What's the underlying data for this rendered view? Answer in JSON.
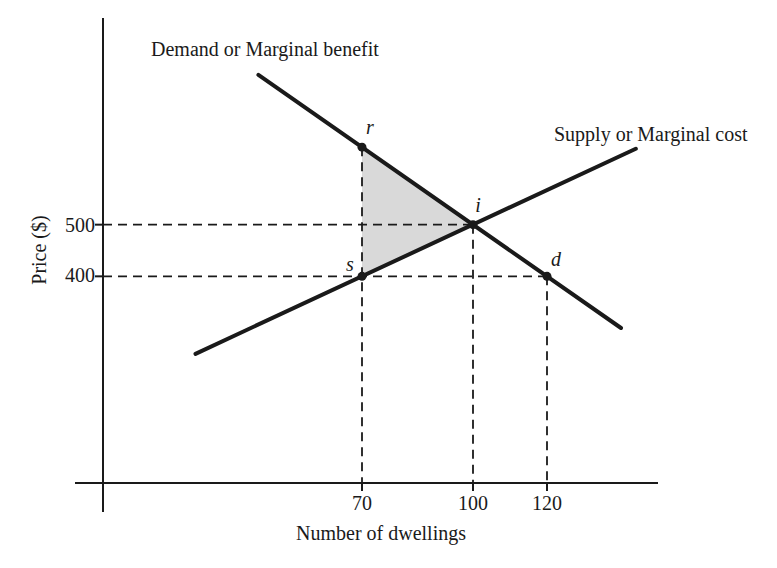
{
  "figure": {
    "background": "#ffffff",
    "line_color": "#1a1a1a",
    "shade_color": "#d9d9d9"
  },
  "chart_data": {
    "type": "line",
    "title": "",
    "xlabel": "Number of dwellings",
    "ylabel": "Price ($)",
    "xlim": [
      0,
      150
    ],
    "ylim": [
      0,
      900
    ],
    "x_ticks": [
      70,
      100,
      120
    ],
    "y_ticks": [
      500,
      400
    ],
    "grid": "off",
    "legend": "inline-labels",
    "series": [
      {
        "name": "Demand or Marginal benefit",
        "role": "demand",
        "slope_per_unit": -5,
        "points": [
          [
            42,
            790
          ],
          [
            140,
            300
          ]
        ]
      },
      {
        "name": "Supply or Marginal cost",
        "role": "supply",
        "slope_per_unit": 3.33,
        "points": [
          [
            25,
            250
          ],
          [
            144,
            647
          ]
        ]
      }
    ],
    "markers": [
      {
        "label": "r",
        "x": 70,
        "y": 650
      },
      {
        "label": "s",
        "x": 70,
        "y": 400
      },
      {
        "label": "i",
        "x": 100,
        "y": 500
      },
      {
        "label": "d",
        "x": 120,
        "y": 400
      }
    ],
    "shaded_triangle": {
      "vertices": [
        [
          70,
          650
        ],
        [
          100,
          500
        ],
        [
          70,
          400
        ]
      ],
      "color": "#d9d9d9",
      "meaning": "area between marginal benefit and marginal cost from 70 to 100 dwellings"
    },
    "dashed_guides": [
      {
        "from": [
          0,
          500
        ],
        "to": [
          100,
          500
        ]
      },
      {
        "from": [
          0,
          400
        ],
        "to": [
          120,
          400
        ]
      },
      {
        "from": [
          70,
          650
        ],
        "to": [
          70,
          0
        ]
      },
      {
        "from": [
          100,
          500
        ],
        "to": [
          100,
          0
        ]
      },
      {
        "from": [
          120,
          400
        ],
        "to": [
          120,
          0
        ]
      }
    ]
  }
}
